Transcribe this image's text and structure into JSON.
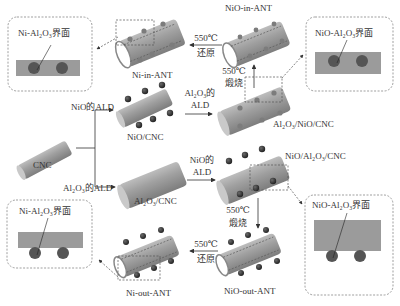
{
  "diagram": {
    "nodes": {
      "cnc": "CNC",
      "nio_cnc": "NiO/CNC",
      "al2o3_cnc": "Al₂O₃/CNC",
      "al2o3_nio_cnc": "Al₂O₃/NiO/CNC",
      "nio_al2o3_cnc": "NiO/Al₂O₃/CNC",
      "nio_in_ant": "NiO-in-ANT",
      "ni_in_ant": "Ni-in-ANT",
      "nio_out_ant": "NiO-out-ANT",
      "ni_out_ant": "Ni-out-ANT"
    },
    "steps": {
      "nio_ald": "NiO的ALD",
      "al2o3_ald": "Al₂O₃的ALD",
      "al2o3_ald_line1": "Al₂O₃的",
      "al2o3_ald_line2": "ALD",
      "nio_ald_line1": "NiO的",
      "nio_ald_line2": "ALD",
      "calcine_temp": "550℃",
      "calcine": "煅烧",
      "reduce_temp": "550℃",
      "reduce": "还原"
    },
    "insets": {
      "ni_in": "Ni-Al₂O₃界面",
      "nio_in": "NiO-Al₂O₃界面",
      "nio_out": "NiO-Al₂O₃界面",
      "ni_out": "Ni-Al₂O₃界面"
    },
    "colors": {
      "tube": "#9a9a9a",
      "tube_light": "#c8c8c8",
      "particle_dark": "#2e2e2e",
      "particle_embedded": "#7a7a7a",
      "inset_bar": "#9b9b9b",
      "dashed": "#555555"
    }
  }
}
